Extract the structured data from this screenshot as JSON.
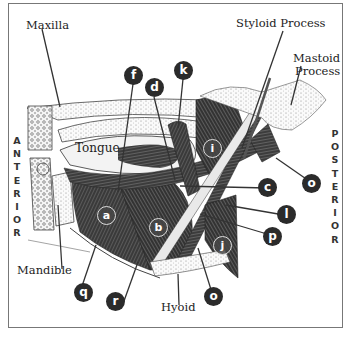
{
  "figure": {
    "labels": {
      "maxilla": "Maxilla",
      "tongue": "Tongue",
      "styloid": "Styloid Process",
      "mastoid_1": "Mastoid",
      "mastoid_2": "Process",
      "mandible": "Mandible",
      "hyoid": "Hyoid"
    },
    "side_labels": {
      "anterior": [
        "A",
        "N",
        "T",
        "E",
        "R",
        "I",
        "O",
        "R"
      ],
      "posterior": [
        "P",
        "O",
        "S",
        "T",
        "E",
        "R",
        "I",
        "O",
        "R"
      ]
    },
    "badges": {
      "a": "a",
      "b": "b",
      "c": "c",
      "d": "d",
      "f": "f",
      "i": "i",
      "j": "j",
      "k": "k",
      "l": "l",
      "o_top": "o",
      "o_bottom": "o",
      "p": "p",
      "q": "q",
      "r": "r"
    }
  }
}
